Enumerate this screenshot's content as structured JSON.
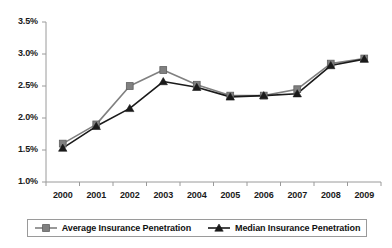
{
  "chart_data": {
    "type": "line",
    "title": "",
    "xlabel": "",
    "ylabel": "",
    "categories": [
      "2000",
      "2001",
      "2002",
      "2003",
      "2004",
      "2005",
      "2006",
      "2007",
      "2008",
      "2009"
    ],
    "series": [
      {
        "name": "Average Insurance Penetration",
        "marker": "square",
        "color": "#808080",
        "values": [
          1.6,
          1.9,
          2.5,
          2.75,
          2.52,
          2.35,
          2.35,
          2.45,
          2.85,
          2.93
        ]
      },
      {
        "name": "Median Insurance Penetration",
        "marker": "triangle",
        "color": "#1a1a1a",
        "values": [
          1.53,
          1.87,
          2.15,
          2.57,
          2.48,
          2.33,
          2.35,
          2.38,
          2.82,
          2.92
        ]
      }
    ],
    "ylim": [
      1.0,
      3.5
    ],
    "ytick_values": [
      1.0,
      1.5,
      2.0,
      2.5,
      3.0,
      3.5
    ],
    "ytick_labels": [
      "1.0%",
      "1.5%",
      "2.0%",
      "2.5%",
      "3.0%",
      "3.5%"
    ],
    "grid": false,
    "legend_position": "bottom"
  },
  "axis": {
    "y_labels": [
      "3.5%",
      "3.0%",
      "2.5%",
      "2.0%",
      "1.5%",
      "1.0%"
    ],
    "x_labels": [
      "2000",
      "2001",
      "2002",
      "2003",
      "2004",
      "2005",
      "2006",
      "2007",
      "2008",
      "2009"
    ]
  },
  "legend": {
    "items": [
      {
        "label": "Average Insurance Penetration",
        "marker": "square-marker",
        "color": "#808080"
      },
      {
        "label": "Median Insurance Penetration",
        "marker": "triangle-marker",
        "color": "#1a1a1a"
      }
    ]
  },
  "colors": {
    "average_series": "#808080",
    "median_series": "#1a1a1a",
    "axis": "#9a9a9a",
    "text": "#111111",
    "background": "#ffffff"
  }
}
